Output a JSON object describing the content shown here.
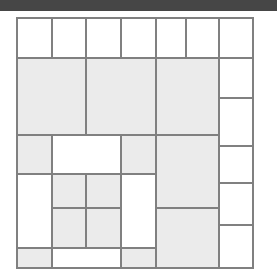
{
  "page": {
    "width": 277,
    "height": 276,
    "background_color": "#ffffff"
  },
  "top_band": {
    "name": "top-band",
    "color": "#464646",
    "x": 0,
    "y": 0,
    "width": 277,
    "height": 11
  },
  "palette": {
    "fill_white": "#ffffff",
    "fill_gray": "#ebebeb",
    "stroke": "#808080",
    "stroke_width": 1.6,
    "band_dark": "#464646",
    "page_background": "#ffffff"
  },
  "grid": {
    "x_min": 17,
    "x_max": 253,
    "y_min": 18,
    "y_max": 268,
    "column_edges": [
      17,
      52,
      86,
      121,
      140,
      156,
      186,
      219,
      253
    ],
    "row_edges": [
      18,
      58,
      98,
      135,
      146,
      174,
      183,
      208,
      225,
      248,
      268
    ],
    "cell_count": 37
  },
  "chart_data": {
    "type": "treemap",
    "title": "",
    "xlabel": "",
    "ylabel": "",
    "legend": [],
    "grid": false,
    "categories": [
      "white",
      "gray"
    ],
    "cells": [
      {
        "id": "r1c1",
        "x": 17,
        "y": 18,
        "w": 35,
        "h": 40,
        "fill": "white"
      },
      {
        "id": "r1c2",
        "x": 52,
        "y": 18,
        "w": 34,
        "h": 40,
        "fill": "white"
      },
      {
        "id": "r1c3",
        "x": 86,
        "y": 18,
        "w": 35,
        "h": 40,
        "fill": "white"
      },
      {
        "id": "r1c4",
        "x": 121,
        "y": 18,
        "w": 35,
        "h": 40,
        "fill": "white"
      },
      {
        "id": "r1c5",
        "x": 156,
        "y": 18,
        "w": 30,
        "h": 40,
        "fill": "white"
      },
      {
        "id": "r1c6",
        "x": 186,
        "y": 18,
        "w": 33,
        "h": 40,
        "fill": "white"
      },
      {
        "id": "r1c7",
        "x": 219,
        "y": 18,
        "w": 34,
        "h": 40,
        "fill": "white"
      },
      {
        "id": "r2c1",
        "x": 17,
        "y": 58,
        "w": 69,
        "h": 77,
        "fill": "gray"
      },
      {
        "id": "r2c2",
        "x": 86,
        "y": 58,
        "w": 70,
        "h": 77,
        "fill": "gray"
      },
      {
        "id": "r2c3",
        "x": 156,
        "y": 58,
        "w": 63,
        "h": 77,
        "fill": "gray"
      },
      {
        "id": "r2c4",
        "x": 219,
        "y": 58,
        "w": 34,
        "h": 40,
        "fill": "white"
      },
      {
        "id": "r2c5",
        "x": 219,
        "y": 98,
        "w": 34,
        "h": 48,
        "fill": "white"
      },
      {
        "id": "r3c1",
        "x": 17,
        "y": 135,
        "w": 35,
        "h": 39,
        "fill": "gray"
      },
      {
        "id": "r3c2",
        "x": 52,
        "y": 135,
        "w": 69,
        "h": 39,
        "fill": "white"
      },
      {
        "id": "r3c3",
        "x": 121,
        "y": 135,
        "w": 35,
        "h": 39,
        "fill": "gray"
      },
      {
        "id": "r3c4",
        "x": 156,
        "y": 135,
        "w": 63,
        "h": 73,
        "fill": "gray"
      },
      {
        "id": "r4c1",
        "x": 17,
        "y": 174,
        "w": 35,
        "h": 74,
        "fill": "white"
      },
      {
        "id": "r4c2",
        "x": 52,
        "y": 174,
        "w": 34,
        "h": 34,
        "fill": "gray"
      },
      {
        "id": "r4c3",
        "x": 86,
        "y": 174,
        "w": 35,
        "h": 34,
        "fill": "gray"
      },
      {
        "id": "r4c4",
        "x": 121,
        "y": 174,
        "w": 35,
        "h": 74,
        "fill": "white"
      },
      {
        "id": "r4c5",
        "x": 219,
        "y": 146,
        "w": 34,
        "h": 37,
        "fill": "white"
      },
      {
        "id": "r5c1",
        "x": 52,
        "y": 208,
        "w": 34,
        "h": 40,
        "fill": "gray"
      },
      {
        "id": "r5c2",
        "x": 86,
        "y": 208,
        "w": 35,
        "h": 40,
        "fill": "gray"
      },
      {
        "id": "r5c3",
        "x": 156,
        "y": 208,
        "w": 63,
        "h": 60,
        "fill": "gray"
      },
      {
        "id": "r5c4",
        "x": 219,
        "y": 183,
        "w": 34,
        "h": 42,
        "fill": "white"
      },
      {
        "id": "r5c5",
        "x": 219,
        "y": 225,
        "w": 34,
        "h": 43,
        "fill": "white"
      },
      {
        "id": "r6c1",
        "x": 17,
        "y": 248,
        "w": 35,
        "h": 20,
        "fill": "gray"
      },
      {
        "id": "r6c2",
        "x": 52,
        "y": 248,
        "w": 69,
        "h": 20,
        "fill": "white"
      },
      {
        "id": "r6c3",
        "x": 121,
        "y": 248,
        "w": 35,
        "h": 20,
        "fill": "gray"
      }
    ]
  }
}
